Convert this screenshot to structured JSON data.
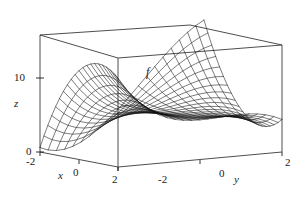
{
  "figure": {
    "kind": "3d-surface-wireframe-plot",
    "background_color": "#ffffff",
    "line_color": "#1a1a1a",
    "box_color": "#3a3a3a"
  },
  "labels": {
    "surface_label": "f",
    "z_axis_name": "z",
    "x_axis_name": "x",
    "y_axis_name": "y"
  },
  "ticks": {
    "z": [
      "10",
      "0"
    ],
    "x": [
      "-2",
      "0",
      "2"
    ],
    "y": [
      "-2",
      "0",
      "2"
    ]
  },
  "chart_data": {
    "type": "surface",
    "title": "",
    "surface_label": "f",
    "xlabel": "x",
    "ylabel": "y",
    "zlabel": "z",
    "xlim": [
      -2,
      2
    ],
    "ylim": [
      -2,
      2
    ],
    "zlim": [
      0,
      15
    ],
    "xticks": [
      -2,
      0,
      2
    ],
    "yticks": [
      -2,
      0,
      2
    ],
    "zticks": [
      0,
      10
    ],
    "grid": false,
    "legend": "none",
    "mesh_divisions_x": 20,
    "mesh_divisions_y": 20,
    "expression": "f(x,y) = 3*y^2 - 2*y^3 + 3*x^2*y - 6*x*y",
    "features": [
      "local maximum hump near x = -2 at low y",
      "valley trough running diagonally across the domain",
      "steep rise toward the back (y = -2) corner",
      "steep rise toward the right (y = 2) edge"
    ],
    "view": {
      "azimuth_deg": -60,
      "elevation_deg": 22
    }
  }
}
